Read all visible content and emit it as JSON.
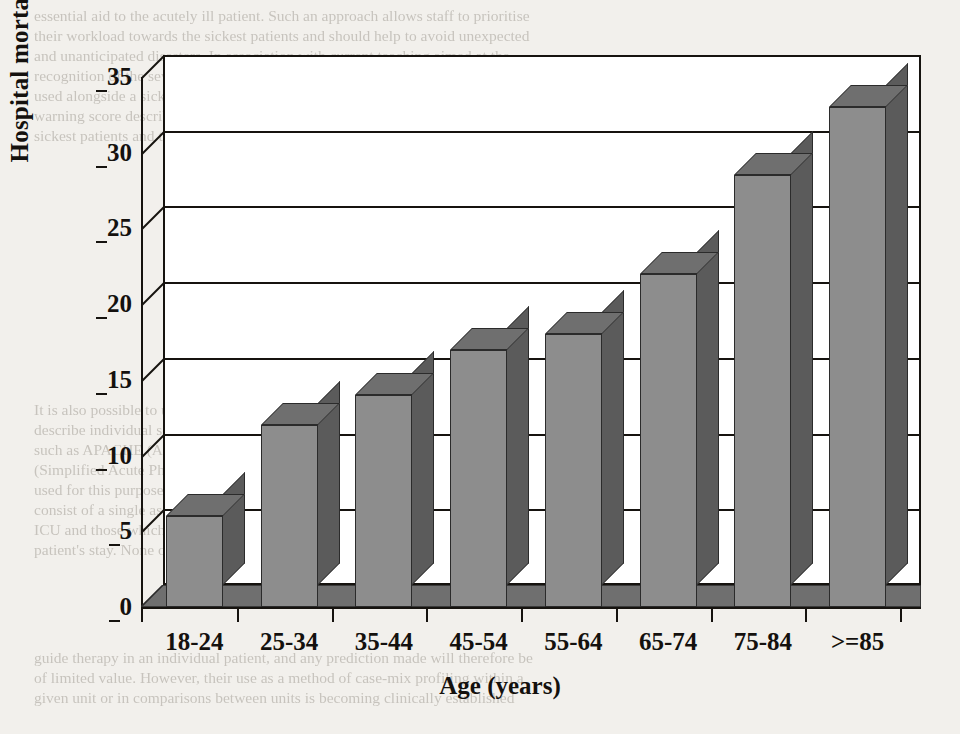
{
  "chart_data": {
    "type": "bar",
    "title": "",
    "xlabel": "Age (years)",
    "ylabel": "Hospital mortality (%)",
    "categories": [
      "18-24",
      "25-34",
      "35-44",
      "45-54",
      "55-64",
      "65-74",
      "75-84",
      ">=85"
    ],
    "values": [
      6,
      12,
      14,
      17,
      18,
      22,
      28.5,
      33
    ],
    "series": [
      {
        "name": "Hospital mortality",
        "values": [
          6,
          12,
          14,
          17,
          18,
          22,
          28.5,
          33
        ]
      }
    ],
    "ylim": [
      0,
      35
    ],
    "yticks": [
      0,
      5,
      10,
      15,
      20,
      25,
      30,
      35
    ],
    "ytick_labels": [
      "0",
      "5",
      "10",
      "15",
      "20",
      "25",
      "30",
      "35"
    ],
    "grid": "horizontal",
    "legend": "none",
    "style": "3d-column",
    "colors": {
      "bar_front": "#8d8d8d",
      "bar_side": "#5b5b5b",
      "bar_top": "#6f6f6f",
      "outline": "#2b2b2b",
      "axis": "#16130f",
      "plot_background": "#ffffff",
      "page_background": "#f2f0ec"
    }
  },
  "page_text": {
    "top": [
      "essential aid to the acutely ill patient. Such an approach allows staff to prioritise",
      "their workload towards the sickest patients and should help to avoid unexpected",
      "and unanticipated disasters. In association with current teaching aimed at the",
      "recognition of the severely ill patient.",
      "used alongside a sick patient triage tool, the early",
      "warning score described above allows clinical staff to focus better care on to the",
      "sickest patients and to identify them earlier in the course of their illness."
    ],
    "heading": "Scoring the critically ill patient",
    "bottom": [
      "It is also possible to use severity scoring within the intensive care unit (ICU) to",
      "describe individual severity of illness and in an effort to predict outcome. Systems",
      "such as APACHE (Acute Physiology And Chronic Health Evaluation), SAPS",
      "(Simplified Acute Physiology Score) and MPM (Mortality Prediction Model) are",
      "used for this purpose. Such systems fall into two broad categories: those which",
      "consist of a single assessment of severity within the first 24 hours of admission to",
      "ICU and those which offer repeated estimates of severity over the course of a",
      "patient's stay. None of these scoring systems are sufficiently accurate to be used to",
      "guide therapy in an individual patient, and any prediction made will therefore be",
      "of limited value. However, their use as a method of case-mix profiling within a",
      "given unit or in comparisons between units is becoming clinically established"
    ]
  }
}
